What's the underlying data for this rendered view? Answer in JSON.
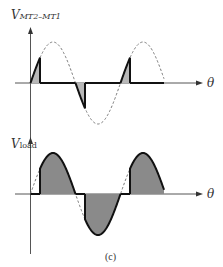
{
  "figure": {
    "caption": "(c)",
    "top_plot": {
      "ylabel_main": "V",
      "ylabel_sub": "MT2–MT1",
      "xlabel": "θ"
    },
    "bottom_plot": {
      "ylabel_main": "V",
      "ylabel_sub": "load",
      "xlabel": "θ"
    },
    "colors": {
      "fill": "#b8b8b8",
      "fill_dark": "#8a8a8a",
      "line": "#111111",
      "dashed": "#777777"
    }
  }
}
